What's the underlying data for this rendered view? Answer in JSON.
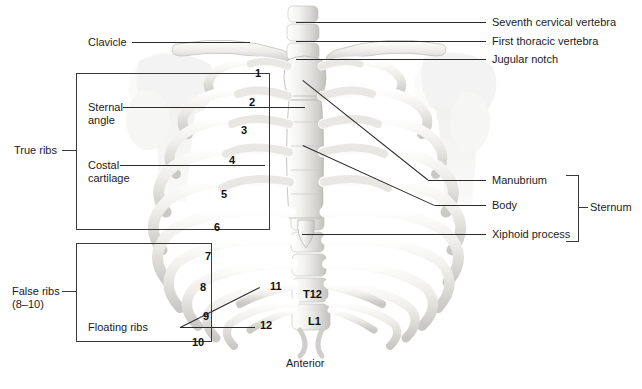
{
  "figure": {
    "orientation_label": "Anterior",
    "background_color": "#ffffff",
    "line_color": "#2b2b2b",
    "text_color": "#1b1b1b",
    "bone_light": "#f2f2f0",
    "bone_mid": "#d6d5d2",
    "bone_shadow": "#b4b3b0"
  },
  "left_labels": [
    {
      "id": "clavicle",
      "text": "Clavicle"
    },
    {
      "id": "sternal-angle",
      "text": "Sternal\nangle"
    },
    {
      "id": "costal-cartilage",
      "text": "Costal\ncartilage"
    },
    {
      "id": "floating-ribs",
      "text": "Floating ribs"
    }
  ],
  "right_labels": [
    {
      "id": "seventh-cervical-vertebra",
      "text": "Seventh cervical vertebra"
    },
    {
      "id": "first-thoracic-vertebra",
      "text": "First thoracic vertebra"
    },
    {
      "id": "jugular-notch",
      "text": "Jugular notch"
    },
    {
      "id": "manubrium",
      "text": "Manubrium"
    },
    {
      "id": "body",
      "text": "Body"
    },
    {
      "id": "xiphoid-process",
      "text": "Xiphoid process"
    }
  ],
  "brackets": [
    {
      "id": "true-ribs",
      "text": "True ribs"
    },
    {
      "id": "false-ribs",
      "text": "False ribs\n(8–10)"
    },
    {
      "id": "sternum",
      "text": "Sternum"
    }
  ],
  "rib_numbers": [
    {
      "n": "1",
      "x": 255,
      "y": 68
    },
    {
      "n": "2",
      "x": 249,
      "y": 97
    },
    {
      "n": "3",
      "x": 241,
      "y": 125
    },
    {
      "n": "4",
      "x": 229,
      "y": 155
    },
    {
      "n": "5",
      "x": 221,
      "y": 189
    },
    {
      "n": "6",
      "x": 214,
      "y": 222
    },
    {
      "n": "7",
      "x": 205,
      "y": 251
    },
    {
      "n": "8",
      "x": 200,
      "y": 282
    },
    {
      "n": "9",
      "x": 203,
      "y": 311
    },
    {
      "n": "10",
      "x": 192,
      "y": 337
    },
    {
      "n": "11",
      "x": 270,
      "y": 281
    },
    {
      "n": "12",
      "x": 260,
      "y": 320
    }
  ],
  "vertebra_labels": [
    {
      "id": "t12",
      "text": "T12",
      "x": 303,
      "y": 288
    },
    {
      "id": "l1",
      "text": "L1",
      "x": 308,
      "y": 315
    }
  ]
}
